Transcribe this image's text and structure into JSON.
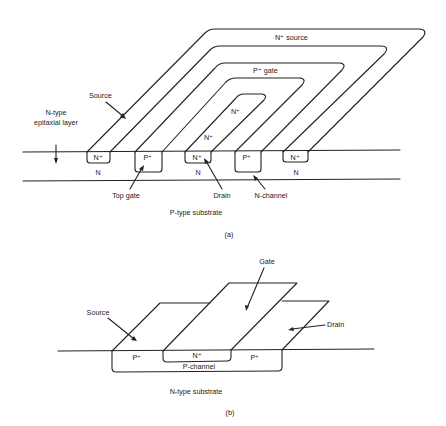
{
  "figure_a": {
    "caption": "(a)",
    "labels": {
      "n_source": "N⁺ source",
      "p_gate": "P⁺ gate",
      "n_inner": "N⁺",
      "n_mid": "N⁺",
      "source": "Source",
      "epi_line1": "N-type",
      "epi_line2": "epitaxial layer",
      "top_gate": "Top gate",
      "drain": "Drain",
      "n_channel": "N-channel",
      "substrate": "P-type substrate"
    },
    "wells": [
      {
        "label": "N⁺",
        "below": "N"
      },
      {
        "label": "P⁺",
        "below": ""
      },
      {
        "label": "N⁺",
        "below": "N"
      },
      {
        "label": "P⁺",
        "below": ""
      },
      {
        "label": "N⁺",
        "below": "N"
      }
    ]
  },
  "figure_b": {
    "caption": "(b)",
    "labels": {
      "gate": "Gate",
      "source": "Source",
      "drain": "Drain",
      "p_left": "P⁺",
      "n_center": "N⁺",
      "p_right": "P⁺",
      "p_channel": "P-channel",
      "substrate": "N-type substrate"
    }
  }
}
